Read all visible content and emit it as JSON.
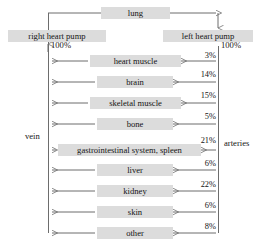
{
  "diagram": {
    "title_nodes": {
      "lung": "lung",
      "right_heart_pump": "right heart pump",
      "left_heart_pump": "left heart pump"
    },
    "side_labels": {
      "vein": "vein",
      "arteries": "arteries"
    },
    "flow_totals": {
      "right_pump_percent": "100%",
      "left_pump_percent": "100%"
    },
    "organs": [
      {
        "label": "heart muscle",
        "percent": "3%"
      },
      {
        "label": "brain",
        "percent": "14%"
      },
      {
        "label": "skeletal muscle",
        "percent": "15%"
      },
      {
        "label": "bone",
        "percent": "5%"
      },
      {
        "label": "gastrointestinal system, spleen",
        "percent": "21%"
      },
      {
        "label": "liver",
        "percent": "6%"
      },
      {
        "label": "kidney",
        "percent": "22%"
      },
      {
        "label": "skin",
        "percent": "6%"
      },
      {
        "label": "other",
        "percent": "8%"
      }
    ],
    "colors": {
      "node_fill": "#dcdcdc",
      "line": "#6d6d6d",
      "text": "#141414",
      "background": "#ffffff"
    }
  }
}
